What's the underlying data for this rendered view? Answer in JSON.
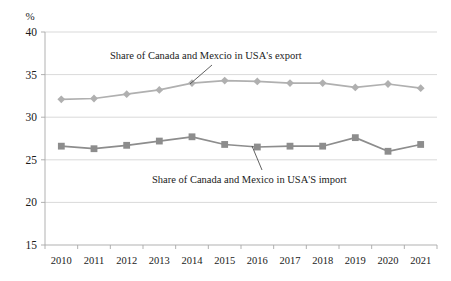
{
  "chart_data": {
    "type": "line",
    "title": "",
    "xlabel": "",
    "ylabel": "%",
    "ylim": [
      15,
      40
    ],
    "yticks": [
      15,
      20,
      25,
      30,
      35,
      40
    ],
    "grid": true,
    "legend": "annotations",
    "categories": [
      "2010",
      "2011",
      "2012",
      "2013",
      "2014",
      "2015",
      "2016",
      "2017",
      "2018",
      "2019",
      "2020",
      "2021"
    ],
    "series": [
      {
        "name": "Share of Canada and Mexcio in USA's export",
        "marker": "diamond",
        "color": "#b0b0b0",
        "values": [
          32.1,
          32.2,
          32.7,
          33.2,
          34.0,
          34.3,
          34.2,
          34.0,
          34.0,
          33.5,
          33.9,
          33.4
        ]
      },
      {
        "name": "Share of Canada and Mexico in USA'S import",
        "marker": "square",
        "color": "#8d8d8d",
        "values": [
          26.6,
          26.3,
          26.7,
          27.2,
          27.7,
          26.8,
          26.5,
          26.6,
          26.6,
          27.6,
          26.0,
          26.8
        ]
      }
    ],
    "annotations": [
      {
        "text": "Share of Canada and Mexcio in USA's export",
        "target_category": "2014",
        "target_value": 34.0
      },
      {
        "text": "Share of Canada and Mexico in USA'S import",
        "target_category": "2016",
        "target_value": 26.5
      }
    ]
  },
  "axis": {
    "unit_label": "%",
    "ytick_labels": [
      "40",
      "35",
      "30",
      "25",
      "20",
      "15"
    ],
    "xtick_labels": [
      "2010",
      "2011",
      "2012",
      "2013",
      "2014",
      "2015",
      "2016",
      "2017",
      "2018",
      "2019",
      "2020",
      "2021"
    ]
  },
  "annotations": {
    "export_label": "Share of Canada and Mexcio in USA's export",
    "import_label": "Share of Canada and Mexico in USA'S import"
  },
  "colors": {
    "export_series": "#b0b0b0",
    "import_series": "#8d8d8d",
    "gridline": "#cfcfcf",
    "axis": "#a8a8a8",
    "text": "#1a1a1a"
  }
}
